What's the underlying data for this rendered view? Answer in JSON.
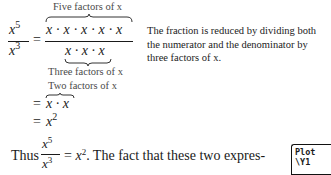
{
  "labels": {
    "five_factors": "Five factors of x",
    "three_factors": "Three factors of x",
    "two_factors": "Two factors of x"
  },
  "equation": {
    "lhs_num_base": "x",
    "lhs_num_exp": "5",
    "lhs_den_base": "x",
    "lhs_den_exp": "3",
    "eq": "=",
    "numerator": "x · x · x · x · x",
    "denominator": "x · x · x",
    "step2": "x · x",
    "step3_base": "x",
    "step3_exp": "2"
  },
  "note": "The fraction is reduced by dividing both the numerator and the denominator by three factors of x.",
  "sentence": {
    "prefix": "Thus",
    "num_base": "x",
    "num_exp": "5",
    "den_base": "x",
    "den_exp": "3",
    "eq": "=",
    "rhs_base": "x",
    "rhs_exp": "2",
    "suffix": ". The fact that these two expres-"
  },
  "calculator": {
    "line1": "Plot",
    "line2": "\\Y1"
  }
}
